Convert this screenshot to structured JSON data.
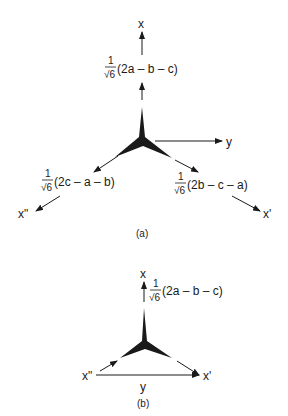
{
  "panel_a": {
    "caption": "(a)",
    "axes": {
      "x": "x",
      "y": "y",
      "x_prime": "x'",
      "x_double_prime": "x\""
    },
    "formulas": {
      "top": {
        "numerator": "1",
        "root": "√6",
        "expr": "(2a – b – c)"
      },
      "left": {
        "numerator": "1",
        "root": "√6",
        "expr": "(2c – a – b)"
      },
      "right": {
        "numerator": "1",
        "root": "√6",
        "expr": "(2b – c – a)"
      }
    }
  },
  "panel_b": {
    "caption": "(b)",
    "axes": {
      "x": "x",
      "y": "y",
      "x_prime": "x'",
      "x_double_prime": "x\""
    },
    "formulas": {
      "top": {
        "numerator": "1",
        "root": "√6",
        "expr": "(2a – b – c)"
      }
    }
  },
  "colors": {
    "ink": "#1a1a1a",
    "background": "#ffffff"
  }
}
